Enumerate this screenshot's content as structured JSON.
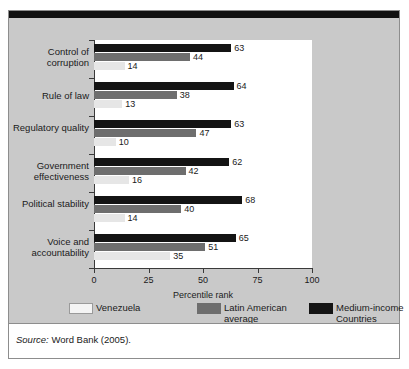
{
  "source": {
    "prefix": "Source:",
    "text": "Word Bank (2005)."
  },
  "legend": {
    "items": [
      {
        "label": "Venezuela",
        "swatch": "light",
        "color": "#f4f4f4"
      },
      {
        "label": "Latin American average",
        "swatch": "mid",
        "color": "#6e6e6e"
      },
      {
        "label": "Medium-income Countries",
        "swatch": "dark",
        "color": "#141414"
      }
    ]
  },
  "chart_data": {
    "type": "bar",
    "orientation": "horizontal",
    "title": "",
    "xlabel": "Percentile rank",
    "ylabel": "",
    "xlim": [
      0,
      100
    ],
    "xticks": [
      0,
      25,
      50,
      75,
      100
    ],
    "grid": false,
    "legend_position": "bottom",
    "categories": [
      "Control of corruption",
      "Rule of law",
      "Regulatory quality",
      "Government effectiveness",
      "Political stability",
      "Voice and accountability"
    ],
    "series": [
      {
        "name": "Medium-income Countries",
        "color": "#141414",
        "values": [
          63,
          64,
          63,
          62,
          68,
          65
        ]
      },
      {
        "name": "Latin American average",
        "color": "#6e6e6e",
        "values": [
          44,
          38,
          47,
          42,
          40,
          51
        ]
      },
      {
        "name": "Venezuela",
        "color": "#f4f4f4",
        "values": [
          14,
          13,
          10,
          16,
          14,
          35
        ]
      }
    ]
  }
}
